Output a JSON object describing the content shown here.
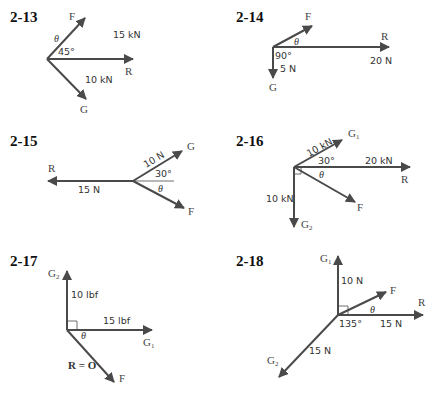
{
  "colors": {
    "vector": "#4a4a4a",
    "text": "#333333",
    "background": "#ffffff"
  },
  "problems": [
    {
      "id": "2-13",
      "labels": {
        "number": "2-13",
        "F": "F",
        "theta": "θ",
        "angle": "45°",
        "magnitude_R": "15 kN",
        "R": "R",
        "magnitude_G": "10 kN",
        "G": "G"
      }
    },
    {
      "id": "2-14",
      "labels": {
        "number": "2-14",
        "F": "F",
        "theta": "θ",
        "angle": "90°",
        "magnitude_G": "5 N",
        "R": "R",
        "magnitude_R": "20 N",
        "G": "G"
      }
    },
    {
      "id": "2-15",
      "labels": {
        "number": "2-15",
        "R": "R",
        "magnitude_R": "15 N",
        "magnitude_G": "10 N",
        "angle": "30°",
        "theta": "θ",
        "G": "G",
        "F": "F"
      }
    },
    {
      "id": "2-16",
      "labels": {
        "number": "2-16",
        "magnitude_G1": "10 kN",
        "G1": "G",
        "G1_sub": "1",
        "angle": "30°",
        "magnitude_R": "20 kN",
        "R": "R",
        "theta": "θ",
        "F": "F",
        "magnitude_G2": "10 kN",
        "G2": "G",
        "G2_sub": "2"
      }
    },
    {
      "id": "2-17",
      "labels": {
        "number": "2-17",
        "G2": "G",
        "G2_sub": "2",
        "magnitude_G2": "10 lbf",
        "magnitude_G1": "15 lbf",
        "theta": "θ",
        "G1": "G",
        "G1_sub": "1",
        "resultant": "R = O",
        "F": "F"
      }
    },
    {
      "id": "2-18",
      "labels": {
        "number": "2-18",
        "G1": "G",
        "G1_sub": "1",
        "magnitude_G1": "10 N",
        "F": "F",
        "R": "R",
        "theta": "θ",
        "angle": "135°",
        "magnitude_R": "15 N",
        "magnitude_G2": "15 N",
        "G2": "G",
        "G2_sub": "2"
      }
    }
  ]
}
